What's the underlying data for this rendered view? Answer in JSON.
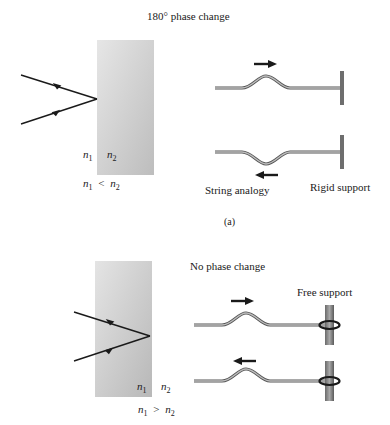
{
  "panel_a": {
    "title": "180° phase change",
    "n1": "n",
    "n1_sub": "1",
    "n2": "n",
    "n2_sub": "2",
    "relation": "<",
    "string_label": "String analogy",
    "support_label": "Rigid support",
    "caption": "(a)"
  },
  "panel_b": {
    "title": "No phase change",
    "n1": "n",
    "n1_sub": "1",
    "n2": "n",
    "n2_sub": "2",
    "relation": ">",
    "support_label": "Free support"
  },
  "colors": {
    "slab_light": "#e0e0e0",
    "slab_dark": "#b9b9b9",
    "ray": "#1a1a1a",
    "string": "#888888",
    "support": "#7a7a7a"
  }
}
